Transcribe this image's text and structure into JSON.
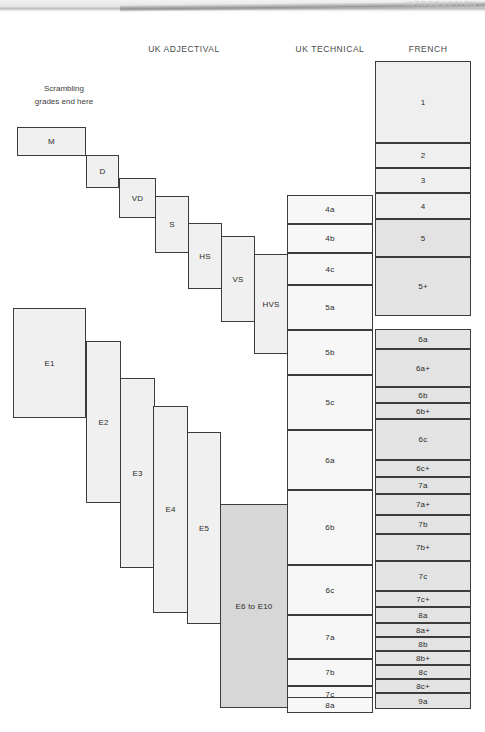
{
  "page": {
    "running_head": "INTRODUCTION"
  },
  "note": {
    "line1": "Scrambling",
    "line2": "grades end here"
  },
  "headers": [
    {
      "label": "UK ADJECTIVAL",
      "x": 104,
      "y": 44,
      "w": 160
    },
    {
      "label": "UK TECHNICAL",
      "x": 287,
      "y": 44,
      "w": 86
    },
    {
      "label": "FRENCH",
      "x": 375,
      "y": 44,
      "w": 106
    }
  ],
  "chart_data": {
    "type": "table",
    "columns": [
      "UK ADJECTIVAL",
      "UK TECHNICAL",
      "FRENCH"
    ],
    "uk_adjectival": [
      "M",
      "D",
      "VD",
      "S",
      "HS",
      "VS",
      "HVS",
      "E1",
      "E2",
      "E3",
      "E4",
      "E5",
      "E6 to E10"
    ],
    "uk_technical": [
      "4a",
      "4b",
      "4c",
      "5a",
      "5b",
      "5c",
      "6a",
      "6b",
      "6c",
      "7a",
      "7b",
      "7c",
      "8a"
    ],
    "french": [
      "1",
      "2",
      "3",
      "4",
      "5",
      "5+",
      "6a",
      "6a+",
      "6b",
      "6b+",
      "6c",
      "6c+",
      "7a",
      "7a+",
      "7b",
      "7b+",
      "7c",
      "7c+",
      "8a",
      "8a+",
      "8b",
      "8b+",
      "8c",
      "8c+",
      "9a"
    ]
  },
  "columns": {
    "uk_adjectival": [
      {
        "label": "M",
        "x": 17,
        "y": 127,
        "w": 69,
        "h": 29,
        "shade": "adj"
      },
      {
        "label": "D",
        "x": 86,
        "y": 155,
        "w": 33,
        "h": 33,
        "shade": "adj"
      },
      {
        "label": "VD",
        "x": 119,
        "y": 178,
        "w": 37,
        "h": 40,
        "shade": "adj"
      },
      {
        "label": "S",
        "x": 155,
        "y": 196,
        "w": 34,
        "h": 57,
        "shade": "adj"
      },
      {
        "label": "HS",
        "x": 188,
        "y": 223,
        "w": 34,
        "h": 66,
        "shade": "adj"
      },
      {
        "label": "VS",
        "x": 221,
        "y": 236,
        "w": 34,
        "h": 86,
        "shade": "adj"
      },
      {
        "label": "HVS",
        "x": 254,
        "y": 254,
        "w": 34,
        "h": 100,
        "shade": "adj"
      },
      {
        "label": "E1",
        "x": 13,
        "y": 308,
        "w": 73,
        "h": 110,
        "shade": "adj"
      },
      {
        "label": "E2",
        "x": 86,
        "y": 341,
        "w": 35,
        "h": 162,
        "shade": "adj"
      },
      {
        "label": "E3",
        "x": 120,
        "y": 378,
        "w": 35,
        "h": 190,
        "shade": "adj"
      },
      {
        "label": "E4",
        "x": 153,
        "y": 406,
        "w": 35,
        "h": 207,
        "shade": "adj"
      },
      {
        "label": "E5",
        "x": 187,
        "y": 432,
        "w": 34,
        "h": 192,
        "shade": "adj"
      },
      {
        "label": "E6 to E10",
        "x": 220,
        "y": 504,
        "w": 68,
        "h": 204,
        "shade": "dark"
      }
    ],
    "uk_technical": [
      {
        "label": "4a",
        "x": 287,
        "y": 195,
        "w": 86,
        "h": 29
      },
      {
        "label": "4b",
        "x": 287,
        "y": 224,
        "w": 86,
        "h": 29
      },
      {
        "label": "4c",
        "x": 287,
        "y": 253,
        "w": 86,
        "h": 32
      },
      {
        "label": "5a",
        "x": 287,
        "y": 285,
        "w": 86,
        "h": 45
      },
      {
        "label": "5b",
        "x": 287,
        "y": 330,
        "w": 86,
        "h": 45
      },
      {
        "label": "5c",
        "x": 287,
        "y": 375,
        "w": 86,
        "h": 55
      },
      {
        "label": "6a",
        "x": 287,
        "y": 430,
        "w": 86,
        "h": 60
      },
      {
        "label": "6b",
        "x": 287,
        "y": 490,
        "w": 86,
        "h": 75
      },
      {
        "label": "6c",
        "x": 287,
        "y": 565,
        "w": 86,
        "h": 50
      },
      {
        "label": "7a",
        "x": 287,
        "y": 615,
        "w": 86,
        "h": 44
      },
      {
        "label": "7b",
        "x": 287,
        "y": 659,
        "w": 86,
        "h": 27
      },
      {
        "label": "7c",
        "x": 287,
        "y": 686,
        "w": 86,
        "h": 16
      },
      {
        "label": "8a",
        "x": 287,
        "y": 697,
        "w": 86,
        "h": 16
      }
    ],
    "french": [
      {
        "label": "1",
        "x": 375,
        "y": 61,
        "w": 96,
        "h": 82,
        "shade": "fr"
      },
      {
        "label": "2",
        "x": 375,
        "y": 143,
        "w": 96,
        "h": 25,
        "shade": "fr"
      },
      {
        "label": "3",
        "x": 375,
        "y": 168,
        "w": 96,
        "h": 25,
        "shade": "fr"
      },
      {
        "label": "4",
        "x": 375,
        "y": 193,
        "w": 96,
        "h": 26,
        "shade": "fr"
      },
      {
        "label": "5",
        "x": 375,
        "y": 219,
        "w": 96,
        "h": 38,
        "shade": "fr-dark"
      },
      {
        "label": "5+",
        "x": 375,
        "y": 257,
        "w": 96,
        "h": 59,
        "shade": "fr-dark"
      },
      {
        "label": "6a",
        "x": 375,
        "y": 329,
        "w": 96,
        "h": 20,
        "shade": "fr-dark"
      },
      {
        "label": "6a+",
        "x": 375,
        "y": 349,
        "w": 96,
        "h": 38,
        "shade": "fr-dark"
      },
      {
        "label": "6b",
        "x": 375,
        "y": 387,
        "w": 96,
        "h": 16,
        "shade": "fr-dark"
      },
      {
        "label": "6b+",
        "x": 375,
        "y": 403,
        "w": 96,
        "h": 16,
        "shade": "fr-dark"
      },
      {
        "label": "6c",
        "x": 375,
        "y": 419,
        "w": 96,
        "h": 41,
        "shade": "fr-dark"
      },
      {
        "label": "6c+",
        "x": 375,
        "y": 460,
        "w": 96,
        "h": 17,
        "shade": "fr-dark"
      },
      {
        "label": "7a",
        "x": 375,
        "y": 477,
        "w": 96,
        "h": 17,
        "shade": "fr-dark"
      },
      {
        "label": "7a+",
        "x": 375,
        "y": 494,
        "w": 96,
        "h": 21,
        "shade": "fr-dark"
      },
      {
        "label": "7b",
        "x": 375,
        "y": 515,
        "w": 96,
        "h": 19,
        "shade": "fr-dark"
      },
      {
        "label": "7b+",
        "x": 375,
        "y": 534,
        "w": 96,
        "h": 27,
        "shade": "fr-dark"
      },
      {
        "label": "7c",
        "x": 375,
        "y": 561,
        "w": 96,
        "h": 30,
        "shade": "fr-dark"
      },
      {
        "label": "7c+",
        "x": 375,
        "y": 591,
        "w": 96,
        "h": 16,
        "shade": "fr-dark"
      },
      {
        "label": "8a",
        "x": 375,
        "y": 607,
        "w": 96,
        "h": 16,
        "shade": "fr-dark"
      },
      {
        "label": "8a+",
        "x": 375,
        "y": 623,
        "w": 96,
        "h": 14,
        "shade": "fr-dark"
      },
      {
        "label": "8b",
        "x": 375,
        "y": 637,
        "w": 96,
        "h": 14,
        "shade": "fr-dark"
      },
      {
        "label": "8b+",
        "x": 375,
        "y": 651,
        "w": 96,
        "h": 14,
        "shade": "fr-dark"
      },
      {
        "label": "8c",
        "x": 375,
        "y": 665,
        "w": 96,
        "h": 14,
        "shade": "fr-dark"
      },
      {
        "label": "8c+",
        "x": 375,
        "y": 679,
        "w": 96,
        "h": 14,
        "shade": "fr-dark"
      },
      {
        "label": "9a",
        "x": 375,
        "y": 693,
        "w": 96,
        "h": 16,
        "shade": "fr-dark"
      }
    ]
  }
}
